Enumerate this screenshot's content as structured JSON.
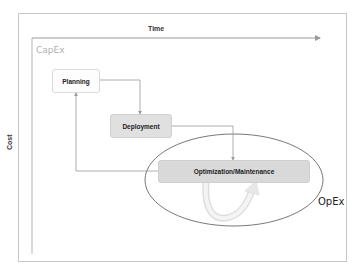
{
  "diagram": {
    "axes": {
      "x_label": "Time",
      "y_label": "Cost"
    },
    "regions": {
      "capex_label": "CapEx",
      "opex_label": "OpEx"
    },
    "nodes": [
      {
        "id": "planning",
        "label": "Planning",
        "fill": "#fdfdfd"
      },
      {
        "id": "deployment",
        "label": "Deployment",
        "fill": "#e0e0e0"
      },
      {
        "id": "optimization_maintenance",
        "label": "Optimization/Maintenance",
        "fill": "#d9d9d9"
      }
    ],
    "edges": [
      {
        "from": "planning",
        "to": "deployment"
      },
      {
        "from": "deployment",
        "to": "optimization_maintenance"
      },
      {
        "from": "optimization_maintenance",
        "to": "planning"
      },
      {
        "from": "optimization_maintenance",
        "to": "optimization_maintenance",
        "type": "loop"
      }
    ],
    "colors": {
      "line": "#9a9a9a",
      "ellipse": "#555555",
      "loop_arrow": "#e6e6e6",
      "capex_text": "#b0b0b0"
    }
  }
}
